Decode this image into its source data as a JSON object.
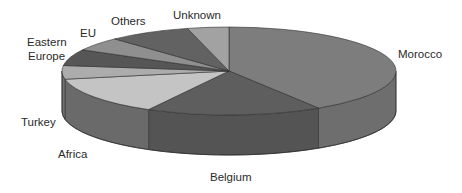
{
  "chart_data": {
    "type": "pie",
    "style": "3d",
    "title": "",
    "categories": [
      "Morocco",
      "Belgium",
      "Africa",
      "Turkey",
      "Eastern Europe",
      "EU",
      "Others",
      "Unknown"
    ],
    "values": [
      41,
      17,
      14,
      5,
      6,
      5,
      8,
      4
    ],
    "unit": "%",
    "legend": "none (direct labels)",
    "colors": [
      "#7d7d7d",
      "#5e5e5e",
      "#c4c4c4",
      "#acacac",
      "#565656",
      "#8f8f8f",
      "#626262",
      "#a2a2a2"
    ],
    "side_colors": [
      "#6e6e6e",
      "#545454",
      "#6a6a6a",
      "#727272",
      "#4e4e4e",
      "#7a7a7a",
      "#575757",
      "#8a8a8a"
    ],
    "start_angle_deg": 90,
    "direction": "counterclockwise"
  },
  "labels": {
    "morocco": "Morocco",
    "belgium": "Belgium",
    "africa": "Africa",
    "turkey": "Turkey",
    "eastern_europe_line1": "Eastern",
    "eastern_europe_line2": "Europe",
    "eu": "EU",
    "others": "Others",
    "unknown": "Unknown"
  }
}
